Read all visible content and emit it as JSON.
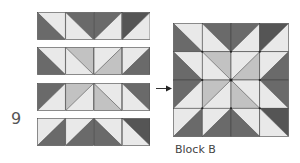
{
  "step_number": "9",
  "caption": "Block B",
  "colors": {
    "dark": "#6a6a6a",
    "darker": "#555555",
    "medium": "#c2c2c2",
    "light": "#e9e9e9",
    "seam": "#444444"
  },
  "cell_legend": {
    "d": "diagonal top-left to bottom-right; c1 = upper-right half, c2 = lower-left half",
    "a": "diagonal bottom-left to top-right; c1 = upper-left half, c2 = lower-right half"
  },
  "rows": [
    [
      {
        "dir": "d",
        "c1": "light",
        "c2": "dark"
      },
      {
        "dir": "d",
        "c1": "dark",
        "c2": "light"
      },
      {
        "dir": "a",
        "c1": "dark",
        "c2": "light"
      },
      {
        "dir": "a",
        "c1": "darker",
        "c2": "light"
      }
    ],
    [
      {
        "dir": "d",
        "c1": "light",
        "c2": "dark"
      },
      {
        "dir": "d",
        "c1": "medium",
        "c2": "light"
      },
      {
        "dir": "a",
        "c1": "light",
        "c2": "medium"
      },
      {
        "dir": "a",
        "c1": "light",
        "c2": "dark"
      }
    ],
    [
      {
        "dir": "a",
        "c1": "dark",
        "c2": "light"
      },
      {
        "dir": "a",
        "c1": "medium",
        "c2": "light"
      },
      {
        "dir": "d",
        "c1": "light",
        "c2": "medium"
      },
      {
        "dir": "d",
        "c1": "dark",
        "c2": "light"
      }
    ],
    [
      {
        "dir": "a",
        "c1": "light",
        "c2": "dark"
      },
      {
        "dir": "a",
        "c1": "light",
        "c2": "dark"
      },
      {
        "dir": "d",
        "c1": "light",
        "c2": "dark"
      },
      {
        "dir": "d",
        "c1": "darker",
        "c2": "light"
      }
    ]
  ]
}
